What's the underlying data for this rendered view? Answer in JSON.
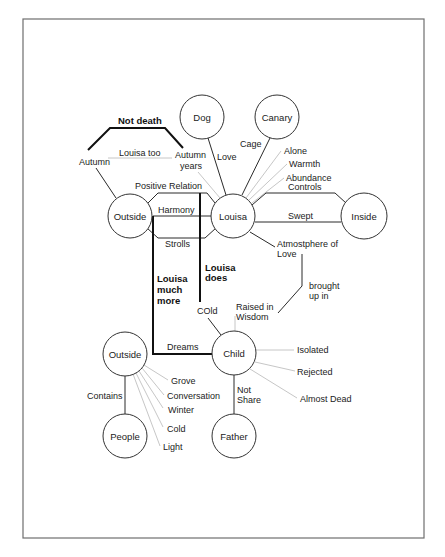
{
  "diagram": {
    "nodes": {
      "dog": "Dog",
      "canary": "Canary",
      "outside_top": "Outside",
      "louisa": "Louisa",
      "inside": "Inside",
      "outside_bottom": "Outside",
      "child": "Child",
      "people": "People",
      "father": "Father"
    },
    "labels": {
      "not_death": "Not death",
      "autumn": "Autumn",
      "louisa_too": "Louisa too",
      "autumn_years_1": "Autumn",
      "autumn_years_2": "years",
      "love": "Love",
      "cage": "Cage",
      "alone": "Alone",
      "warmth": "Warmth",
      "abundance": "Abundance",
      "controls": "Controls",
      "positive_relation": "Positive Relation",
      "harmony": "Harmony",
      "strolls": "Strolls",
      "swept": "Swept",
      "atmosphere_1": "Atmostphere of",
      "atmosphere_2": "Love",
      "brought_1": "brought",
      "brought_2": "up in",
      "louisa_much_1": "Louisa",
      "louisa_much_2": "much",
      "louisa_much_3": "more",
      "louisa_does_1": "Louisa",
      "louisa_does_2": "does",
      "cold_child": "COld",
      "raised_1": "Raised in",
      "raised_2": "Wisdom",
      "dreams": "Dreams",
      "isolated": "Isolated",
      "rejected": "Rejected",
      "almost_dead": "Almost Dead",
      "not_share_1": "Not",
      "not_share_2": "Share",
      "contains": "Contains",
      "grove": "Grove",
      "conversation": "Conversation",
      "winter": "Winter",
      "cold": "Cold",
      "light": "Light"
    }
  }
}
